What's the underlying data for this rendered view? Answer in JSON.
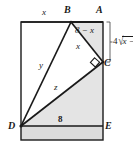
{
  "figure": {
    "colors": {
      "stroke": "#1a1a1a",
      "shade": "#e4e4e4",
      "shade_strip": "#dcdcdc",
      "background": "#ffffff"
    },
    "points": {
      "A": {
        "label": "A",
        "x": 103,
        "y": 22
      },
      "B": {
        "label": "B",
        "x": 71,
        "y": 22
      },
      "C": {
        "label": "C",
        "x": 103,
        "y": 62
      },
      "D": {
        "label": "D",
        "x": 21,
        "y": 126
      },
      "E": {
        "label": "E",
        "x": 103,
        "y": 126
      }
    },
    "segment_labels": {
      "top_left": "x",
      "ba": "8 − x",
      "bc": "x",
      "bd": "y",
      "dc": "z",
      "de": "8"
    },
    "bracket_label": {
      "coefficient": "4",
      "radical": "√",
      "radicand": "x −",
      "full": "4√x −"
    },
    "markers": {
      "right_angle_at": "C"
    }
  }
}
